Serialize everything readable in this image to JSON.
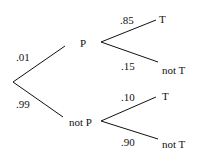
{
  "tree": {
    "root_branches": [
      {
        "prob": ".01",
        "node": "P"
      },
      {
        "prob": ".99",
        "node": "not P"
      }
    ],
    "P_branches": [
      {
        "prob": ".85",
        "outcome": "T"
      },
      {
        "prob": ".15",
        "outcome": "not T"
      }
    ],
    "notP_branches": [
      {
        "prob": ".10",
        "outcome": "T"
      },
      {
        "prob": ".90",
        "outcome": "not T"
      }
    ]
  }
}
